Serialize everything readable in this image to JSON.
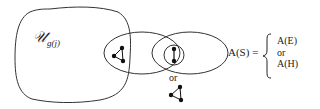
{
  "diagram": {
    "universe_label": "𝒰",
    "universe_subscript": "g(j)",
    "or_label": "or",
    "formula": {
      "lhs": "A(S) =",
      "cases": [
        "A(E)",
        "or",
        "A(H)"
      ]
    },
    "colors": {
      "stroke": "#333333",
      "node": "#111111",
      "background": "#ffffff"
    }
  }
}
